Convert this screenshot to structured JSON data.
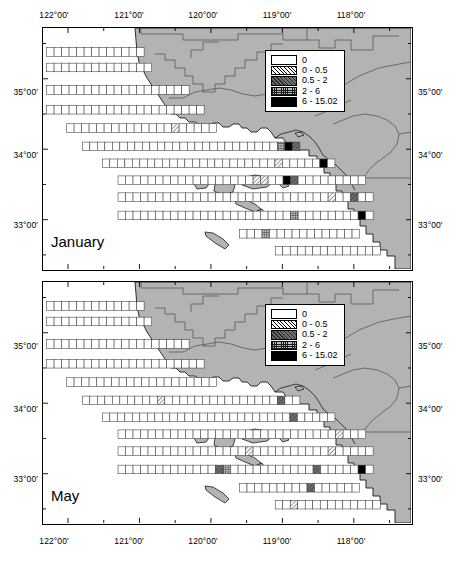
{
  "figure": {
    "kind": "map-figure",
    "width": 464,
    "height": 561,
    "background": "#ffffff",
    "land_color": "#b3b3b3",
    "ocean_color": "#ffffff",
    "line_color": "#000000"
  },
  "axes": {
    "x_label_top": [
      "122°00'",
      "121°00'",
      "120°00'",
      "119°00'",
      "118°00'"
    ],
    "x_label_bottom": [
      "122°00'",
      "121°00'",
      "120°00'",
      "119°00'",
      "118°00'"
    ],
    "y_label_left": [
      "35°00'",
      "34°00'",
      "33°00'"
    ],
    "y_label_right": [
      "35°00'",
      "34°00'",
      "33°00'"
    ],
    "x_ticks_deg": [
      122,
      121,
      120,
      119,
      118
    ],
    "y_ticks_deg": [
      35,
      34,
      33
    ],
    "x_minor_ticks_deg": [
      121.5,
      120.5,
      119.5,
      118.5,
      117.5
    ],
    "y_minor_ticks_deg": [
      35.5,
      34.5,
      33.5,
      32.5
    ],
    "x_range_deg": [
      122.35,
      117.2
    ],
    "y_range_deg": [
      35.72,
      32.3
    ]
  },
  "legend": {
    "title": "",
    "entries": [
      {
        "label": "0",
        "swatch": "white-blank",
        "class": "sw-0"
      },
      {
        "label": "0 - 0.5",
        "swatch": "diagonal-hatch",
        "class": "sw-1"
      },
      {
        "label": "0.5 - 2",
        "swatch": "dark-gray-hatch",
        "class": "sw-2"
      },
      {
        "label": "2 - 6",
        "swatch": "cross-hatch",
        "class": "sw-3"
      },
      {
        "label": "6 - 15.02",
        "swatch": "solid-black",
        "class": "sw-4"
      }
    ]
  },
  "panels": [
    {
      "id": "january",
      "title": "January"
    },
    {
      "id": "may",
      "title": "May"
    }
  ],
  "chart_data": {
    "type": "heatmap",
    "title": "",
    "xlabel": "",
    "ylabel": "",
    "value_bins": [
      "0",
      "0 - 0.5",
      "0.5 - 2",
      "2 - 6",
      "6 - 15.02"
    ],
    "value_min": 0,
    "value_max": 15.02,
    "panels": [
      {
        "name": "January",
        "rows": [
          {
            "y_deg": 35.38,
            "x_start_deg": 122.3,
            "n_cells": 13,
            "filled": []
          },
          {
            "y_deg": 35.16,
            "x_start_deg": 122.3,
            "n_cells": 14,
            "filled": []
          },
          {
            "y_deg": 34.84,
            "x_start_deg": 122.3,
            "n_cells": 19,
            "filled": []
          },
          {
            "y_deg": 34.56,
            "x_start_deg": 122.3,
            "n_cells": 21,
            "filled": []
          },
          {
            "y_deg": 34.3,
            "x_start_deg": 122.02,
            "n_cells": 20,
            "filled": [
              {
                "i": 14,
                "bin": "0 - 0.5"
              }
            ]
          },
          {
            "y_deg": 34.04,
            "x_start_deg": 121.8,
            "n_cells": 29,
            "filled": [
              {
                "i": 26,
                "bin": "2 - 6"
              },
              {
                "i": 27,
                "bin": "6 - 15.02"
              },
              {
                "i": 28,
                "bin": "0.5 - 2"
              }
            ]
          },
          {
            "y_deg": 33.8,
            "x_start_deg": 121.52,
            "n_cells": 31,
            "filled": [
              {
                "i": 23,
                "bin": "0 - 0.5"
              },
              {
                "i": 29,
                "bin": "6 - 15.02"
              }
            ]
          },
          {
            "y_deg": 33.56,
            "x_start_deg": 121.3,
            "n_cells": 33,
            "filled": [
              {
                "i": 18,
                "bin": "0 - 0.5"
              },
              {
                "i": 19,
                "bin": "0 - 0.5"
              },
              {
                "i": 22,
                "bin": "6 - 15.02"
              },
              {
                "i": 23,
                "bin": "0.5 - 2"
              }
            ]
          },
          {
            "y_deg": 33.32,
            "x_start_deg": 121.3,
            "n_cells": 34,
            "filled": [
              {
                "i": 28,
                "bin": "0 - 0.5"
              },
              {
                "i": 31,
                "bin": "0.5 - 2"
              }
            ]
          },
          {
            "y_deg": 33.06,
            "x_start_deg": 121.3,
            "n_cells": 34,
            "filled": [
              {
                "i": 23,
                "bin": "2 - 6"
              },
              {
                "i": 32,
                "bin": "6 - 15.02"
              }
            ]
          },
          {
            "y_deg": 32.8,
            "x_start_deg": 119.6,
            "n_cells": 16,
            "filled": [
              {
                "i": 3,
                "bin": "2 - 6"
              }
            ]
          },
          {
            "y_deg": 32.56,
            "x_start_deg": 119.1,
            "n_cells": 14,
            "filled": []
          }
        ]
      },
      {
        "name": "May",
        "rows": [
          {
            "y_deg": 35.38,
            "x_start_deg": 122.3,
            "n_cells": 13,
            "filled": []
          },
          {
            "y_deg": 35.16,
            "x_start_deg": 122.3,
            "n_cells": 14,
            "filled": []
          },
          {
            "y_deg": 34.84,
            "x_start_deg": 122.3,
            "n_cells": 19,
            "filled": []
          },
          {
            "y_deg": 34.56,
            "x_start_deg": 122.3,
            "n_cells": 21,
            "filled": []
          },
          {
            "y_deg": 34.3,
            "x_start_deg": 122.02,
            "n_cells": 20,
            "filled": []
          },
          {
            "y_deg": 34.04,
            "x_start_deg": 121.8,
            "n_cells": 29,
            "filled": [
              {
                "i": 10,
                "bin": "0 - 0.5"
              },
              {
                "i": 26,
                "bin": "0.5 - 2"
              }
            ]
          },
          {
            "y_deg": 33.8,
            "x_start_deg": 121.52,
            "n_cells": 31,
            "filled": [
              {
                "i": 25,
                "bin": "0.5 - 2"
              }
            ]
          },
          {
            "y_deg": 33.56,
            "x_start_deg": 121.3,
            "n_cells": 33,
            "filled": [
              {
                "i": 29,
                "bin": "0 - 0.5"
              }
            ]
          },
          {
            "y_deg": 33.32,
            "x_start_deg": 121.3,
            "n_cells": 34,
            "filled": [
              {
                "i": 17,
                "bin": "0 - 0.5"
              },
              {
                "i": 28,
                "bin": "0 - 0.5"
              }
            ]
          },
          {
            "y_deg": 33.06,
            "x_start_deg": 121.3,
            "n_cells": 34,
            "filled": [
              {
                "i": 13,
                "bin": "0.5 - 2"
              },
              {
                "i": 14,
                "bin": "2 - 6"
              },
              {
                "i": 26,
                "bin": "0.5 - 2"
              },
              {
                "i": 32,
                "bin": "6 - 15.02"
              }
            ]
          },
          {
            "y_deg": 32.8,
            "x_start_deg": 119.6,
            "n_cells": 16,
            "filled": [
              {
                "i": 9,
                "bin": "0.5 - 2"
              }
            ]
          },
          {
            "y_deg": 32.56,
            "x_start_deg": 119.1,
            "n_cells": 14,
            "filled": [
              {
                "i": 2,
                "bin": "0 - 0.5"
              }
            ]
          }
        ]
      }
    ]
  }
}
